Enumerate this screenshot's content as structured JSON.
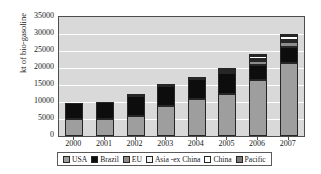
{
  "chart_data": {
    "type": "bar",
    "stacked": true,
    "title": "",
    "xlabel": "",
    "ylabel": "kt of bio-gasoline",
    "ylim": [
      0,
      35000
    ],
    "ytick_labels": [
      "35000",
      "30000",
      "25000",
      "20000",
      "15000",
      "10000",
      "5000",
      "0"
    ],
    "ytick_values": [
      35000,
      30000,
      25000,
      20000,
      15000,
      10000,
      5000,
      0
    ],
    "grid": true,
    "legend_position": "bottom",
    "categories": [
      "2000",
      "2001",
      "2002",
      "2003",
      "2004",
      "2005",
      "2006",
      "2007"
    ],
    "series": [
      {
        "name": "USA",
        "color": "#9e9e9e",
        "values": [
          4900,
          4900,
          5900,
          8700,
          10800,
          12400,
          16500,
          21500
        ]
      },
      {
        "name": "Brazil",
        "color": "#0d0d0d",
        "values": [
          4700,
          5100,
          6000,
          6100,
          6100,
          6100,
          4500,
          4600
        ]
      },
      {
        "name": "EU",
        "color": "#8c8c8c",
        "values": [
          0,
          0,
          300,
          100,
          200,
          400,
          1100,
          1600
        ]
      },
      {
        "name": "Asia -ex China",
        "color": "#f2f2f2",
        "values": [
          0,
          0,
          0,
          0,
          0,
          250,
          500,
          600
        ]
      },
      {
        "name": "China",
        "color": "#ffffff",
        "values": [
          0,
          0,
          0,
          0,
          0,
          300,
          900,
          1000
        ]
      },
      {
        "name": "Pacific",
        "color": "#7a7a7a",
        "values": [
          0,
          0,
          0,
          0,
          0,
          150,
          250,
          500
        ]
      }
    ],
    "totals": [
      9600,
      10000,
      12200,
      14900,
      17100,
      19600,
      23750,
      29800
    ]
  },
  "legend": {
    "items": [
      {
        "label": "USA"
      },
      {
        "label": "Brazil"
      },
      {
        "label": "EU"
      },
      {
        "label": "Asia -ex China"
      },
      {
        "label": "China"
      },
      {
        "label": "Pacific"
      }
    ]
  }
}
